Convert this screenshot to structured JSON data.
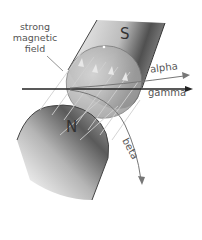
{
  "diagram": {
    "type": "magnetic-field-radiation-deflection",
    "labels": {
      "field": "strong magnetic field",
      "field_lines": [
        "strong",
        "magnetic",
        "field"
      ],
      "south_pole": "S",
      "north_pole": "N",
      "alpha": "alpha",
      "gamma": "gamma",
      "beta": "beta"
    },
    "colors": {
      "background": "#ffffff",
      "magnet_dark": "#4a4a4a",
      "magnet_light": "#f2f2f2",
      "field_disc": "#9a9a9a",
      "beam_gamma": "#222222",
      "beam_alpha": "#777777",
      "beam_beta": "#777777",
      "field_lines": "#c8c8c8"
    }
  }
}
